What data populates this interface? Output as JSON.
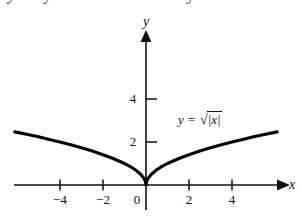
{
  "caption": {
    "text": "y is symmetric about the y-axis"
  },
  "chart_data": {
    "type": "line",
    "title": "",
    "equation_label": {
      "lhs": "y",
      "eq": "=",
      "radical_sign": "√",
      "radicand": "|x|",
      "full": "y = √|x|"
    },
    "xlabel": "x",
    "ylabel": "y",
    "xlim": [
      -6.1,
      6.3
    ],
    "ylim": [
      -1.1,
      6.8
    ],
    "xticks": [
      -4,
      -2,
      0,
      2,
      4
    ],
    "xtick_labels": [
      "−4",
      "−2",
      "0",
      "2",
      "4"
    ],
    "yticks": [
      2,
      4
    ],
    "ytick_labels": [
      "2",
      "4"
    ],
    "grid": false,
    "legend": "none",
    "axis_arrows": [
      "x-positive",
      "y-positive"
    ],
    "series": [
      {
        "name": "y = √|x|",
        "color": "#000000",
        "x": [
          -6.1,
          -5.5,
          -5.0,
          -4.5,
          -4.0,
          -3.5,
          -3.0,
          -2.5,
          -2.0,
          -1.5,
          -1.0,
          -0.7,
          -0.45,
          -0.25,
          -0.1,
          -0.03,
          0,
          0.03,
          0.1,
          0.25,
          0.45,
          0.7,
          1.0,
          1.5,
          2.0,
          2.5,
          3.0,
          3.5,
          4.0,
          4.5,
          5.0,
          5.5,
          6.1
        ],
        "y": [
          2.47,
          2.35,
          2.24,
          2.12,
          2.0,
          1.87,
          1.73,
          1.58,
          1.41,
          1.22,
          1.0,
          0.84,
          0.67,
          0.5,
          0.32,
          0.17,
          0,
          0.17,
          0.32,
          0.5,
          0.67,
          0.84,
          1.0,
          1.22,
          1.41,
          1.58,
          1.73,
          1.87,
          2.0,
          2.12,
          2.24,
          2.35,
          2.47
        ]
      }
    ]
  }
}
